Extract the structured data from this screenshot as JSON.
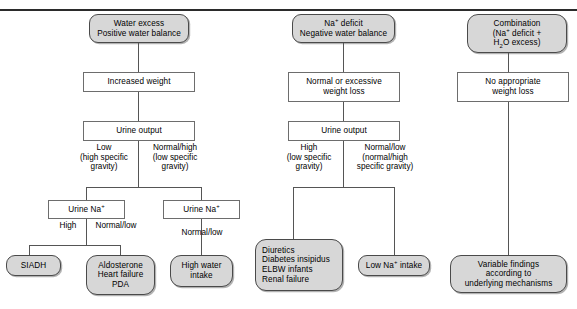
{
  "figure": {
    "rule_color": "#2b2b2b",
    "terminal_fill": "#d7d7d7",
    "process_fill": "#ffffff",
    "line_color": "#555555"
  },
  "branches": {
    "water_excess": {
      "root": "Water excess\nPositive water balance",
      "weight": "Increased weight",
      "urine_output": "Urine output",
      "label_left": "Low\n(high specific\ngravity)",
      "label_right": "Normal/high\n(low specific\ngravity)",
      "urine_na_left": "Urine Na",
      "urine_na_left_sup": "+",
      "urine_na_right": "Urine Na",
      "urine_na_right_sup": "+",
      "label_high": "High",
      "label_normal_low": "Normal/low",
      "label_normal_low_right": "Normal/low",
      "outcome_siadh": "SIADH",
      "outcome_aldosterone": "Aldosterone\nHeart failure\nPDA",
      "outcome_high_water": "High water\nintake"
    },
    "na_deficit": {
      "root_pre": "Na",
      "root_sup": "+",
      "root_post": " deficit\nNegative water balance",
      "weight": "Normal or excessive\nweight loss",
      "urine_output": "Urine output",
      "label_left": "High\n(low specific\ngravity)",
      "label_right": "Normal/low\n(normal/high\nspecific gravity)",
      "outcome_list": "Diuretics\nDiabetes insipidus\nELBW infants\nRenal failure",
      "outcome_low_na_pre": "Low Na",
      "outcome_low_na_sup": "+",
      "outcome_low_na_post": " intake"
    },
    "combination": {
      "root_line1": "Combination",
      "root_line2_pre": "(Na",
      "root_line2_sup": "+",
      "root_line2_post": " deficit +",
      "root_line3_pre": "H",
      "root_line3_sub": "2",
      "root_line3_post": "O excess)",
      "weight": "No appropriate\nweight loss",
      "outcome": "Variable findings\naccording to\nunderlying mechanisms"
    }
  }
}
